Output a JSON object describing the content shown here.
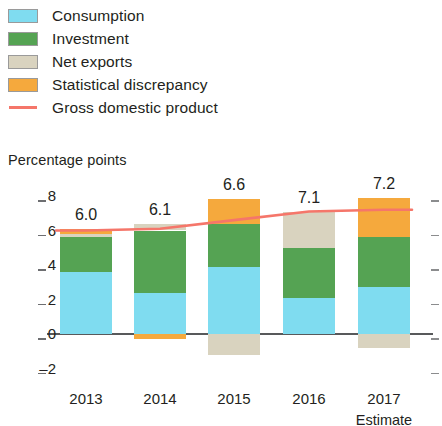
{
  "legend": {
    "items": [
      {
        "label": "Consumption",
        "color": "#7fdcf0",
        "marker": "swatch-icon"
      },
      {
        "label": "Investment",
        "color": "#55a353",
        "marker": "swatch-icon"
      },
      {
        "label": "Net exports",
        "color": "#d9d3bf",
        "marker": "swatch-icon"
      },
      {
        "label": "Statistical discrepancy",
        "color": "#f5a93d",
        "marker": "swatch-icon"
      },
      {
        "label": "Gross domestic product",
        "color": "#f5766a",
        "marker": "line-icon"
      }
    ]
  },
  "axis_title": "Percentage points",
  "estimate_note": "Estimate",
  "chart_data": {
    "type": "bar",
    "title": "",
    "subtitle": "",
    "xlabel": "",
    "ylabel": "Percentage points",
    "ylim": [
      -2,
      8
    ],
    "yticks": [
      8,
      6,
      4,
      2,
      0,
      -2
    ],
    "ytick_labels": [
      "8",
      "6",
      "4",
      "2",
      "0",
      "–2"
    ],
    "grid": false,
    "stacked": true,
    "legend_position": "top-left",
    "categories": [
      "2013",
      "2014",
      "2015",
      "2016",
      "2017"
    ],
    "series": [
      {
        "name": "Consumption",
        "color": "#7fdcf0",
        "values": [
          3.6,
          2.4,
          3.9,
          2.1,
          2.7
        ]
      },
      {
        "name": "Investment",
        "color": "#55a353",
        "values": [
          2.0,
          3.6,
          2.5,
          2.9,
          2.9
        ]
      },
      {
        "name": "Net exports",
        "color": "#d9d3bf",
        "values": [
          0.2,
          0.35,
          -1.2,
          2.1,
          -0.8
        ]
      },
      {
        "name": "Statistical discrepancy",
        "color": "#f5a93d",
        "values": [
          0.3,
          -0.3,
          1.4,
          0.0,
          2.3
        ]
      }
    ],
    "line_series": {
      "name": "Gross domestic product",
      "color": "#f5766a",
      "values": [
        6.0,
        6.1,
        6.6,
        7.1,
        7.2
      ],
      "data_labels": [
        "6.0",
        "6.1",
        "6.6",
        "7.1",
        "7.2"
      ]
    }
  }
}
